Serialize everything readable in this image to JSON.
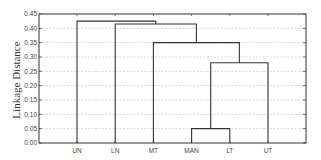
{
  "chart_data": {
    "type": "dendrogram",
    "title": "",
    "xlabel": "",
    "ylabel": "Linkage Distance",
    "ylim": [
      0.0,
      0.45
    ],
    "yticks": [
      "0.00",
      "0.05",
      "0.10",
      "0.15",
      "0.20",
      "0.25",
      "0.30",
      "0.35",
      "0.40",
      "0.45"
    ],
    "grid": "horizontal dotted",
    "leaves": [
      "UN",
      "LN",
      "MT",
      "MAN",
      "LT",
      "UT"
    ],
    "merges": [
      {
        "left": "MAN",
        "right": "LT",
        "height": 0.05
      },
      {
        "left": "MAN+LT",
        "right": "UT",
        "height": 0.28
      },
      {
        "left": "MT",
        "right": "MAN+LT+UT",
        "height": 0.35
      },
      {
        "left": "LN",
        "right": "MT+MAN+LT+UT",
        "height": 0.415
      },
      {
        "left": "UN",
        "right": "LN+MT+MAN+LT+UT",
        "height": 0.425
      }
    ]
  },
  "colors": {
    "line": "#333333",
    "grid": "#bbbbbb",
    "text": "#444444"
  }
}
